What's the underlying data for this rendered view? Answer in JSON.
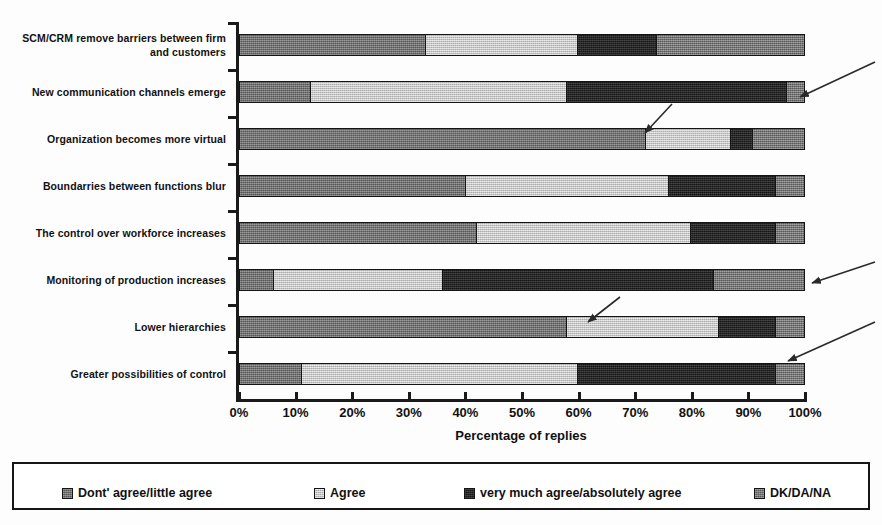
{
  "chart_data": {
    "type": "bar",
    "orientation": "horizontal",
    "stacked": true,
    "stack_mode": "percent",
    "title": "",
    "xlabel": "Percentage of replies",
    "ylabel": "",
    "xlim": [
      0,
      100
    ],
    "grid": false,
    "legend_position": "bottom",
    "x_tick_labels": [
      "0%",
      "10%",
      "20%",
      "30%",
      "40%",
      "50%",
      "60%",
      "70%",
      "80%",
      "90%",
      "100%"
    ],
    "x_tick_values": [
      0,
      10,
      20,
      30,
      40,
      50,
      60,
      70,
      80,
      90,
      100
    ],
    "categories": [
      "SCM/CRM remove barriers between firm and customers",
      "New communication channels emerge",
      "Organization becomes more virtual",
      "Boundarries between functions blur",
      "The control over workforce increases",
      "Monitoring of production increases",
      "Lower hierarchies",
      "Greater possibilities of control"
    ],
    "series": [
      {
        "name": "Dont' agree/little agree",
        "color": "#6e6e6e",
        "values": [
          33,
          12.5,
          72,
          40,
          42,
          6,
          58,
          11
        ]
      },
      {
        "name": "Agree",
        "color": "#cdcdcd",
        "values": [
          27,
          45.5,
          15,
          36,
          38,
          30,
          27,
          49
        ]
      },
      {
        "name": "very much agree/absolutely agree",
        "color": "#242424",
        "values": [
          14,
          39,
          4,
          19,
          15,
          48,
          10,
          35
        ]
      },
      {
        "name": "DK/DA/NA",
        "color": "#737373",
        "values": [
          26,
          3,
          9,
          5,
          5,
          16,
          5,
          5
        ]
      }
    ],
    "cumulative_boundaries": [
      [
        33,
        60,
        74,
        100
      ],
      [
        12.5,
        58,
        97,
        100
      ],
      [
        72,
        87,
        91,
        100
      ],
      [
        40,
        76,
        95,
        100
      ],
      [
        42,
        80,
        95,
        100
      ],
      [
        6,
        36,
        84,
        100
      ],
      [
        58,
        85,
        95,
        100
      ],
      [
        11,
        60,
        95,
        100
      ]
    ]
  },
  "legend": {
    "items": [
      {
        "label": "Dont' agree/little agree",
        "swatch": "legend-swatch-dont-agree"
      },
      {
        "label": "Agree",
        "swatch": "legend-swatch-agree"
      },
      {
        "label": "very much agree/absolutely agree",
        "swatch": "legend-swatch-very-much-agree"
      },
      {
        "label": "DK/DA/NA",
        "swatch": "legend-swatch-dk-da-na"
      }
    ]
  },
  "annotations": {
    "callout_arrows": [
      {
        "name": "arrow-to-new-communication-bar",
        "from": [
          875,
          62
        ],
        "to": [
          800,
          97
        ]
      },
      {
        "name": "arrow-into-organization-bar",
        "from": [
          672,
          104
        ],
        "to": [
          645,
          133
        ]
      },
      {
        "name": "arrow-to-monitoring-bar",
        "from": [
          875,
          262
        ],
        "to": [
          812,
          283
        ]
      },
      {
        "name": "arrow-into-lower-hierarchies-bar",
        "from": [
          620,
          297
        ],
        "to": [
          588,
          322
        ]
      },
      {
        "name": "arrow-to-greater-possibilities-bar",
        "from": [
          875,
          322
        ],
        "to": [
          788,
          361
        ]
      }
    ]
  }
}
